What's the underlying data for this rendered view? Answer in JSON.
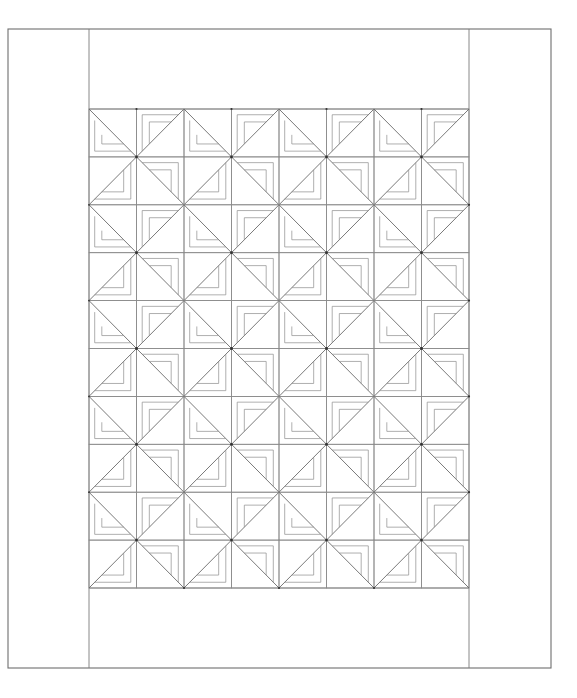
{
  "diagram": {
    "grid": {
      "columns": 8,
      "rows": 10
    },
    "block_pattern": {
      "repeat": "2x2",
      "tiles": [
        {
          "col_parity": "even",
          "row_parity": "even",
          "diagonal": "top-left-to-bottom-right",
          "strip_corner": "bottom-left"
        },
        {
          "col_parity": "odd",
          "row_parity": "even",
          "diagonal": "bottom-left-to-top-right",
          "strip_corner": "top-left"
        },
        {
          "col_parity": "even",
          "row_parity": "odd",
          "diagonal": "bottom-left-to-top-right",
          "strip_corner": "bottom-right"
        },
        {
          "col_parity": "odd",
          "row_parity": "odd",
          "diagonal": "top-left-to-bottom-right",
          "strip_corner": "top-right"
        }
      ],
      "strips_per_triangle": 2
    },
    "borders": {
      "side_borders": 2,
      "top_border": true,
      "bottom_border": true
    },
    "colors": {
      "background": "#ffffff",
      "line": "#6e6e6e"
    }
  }
}
